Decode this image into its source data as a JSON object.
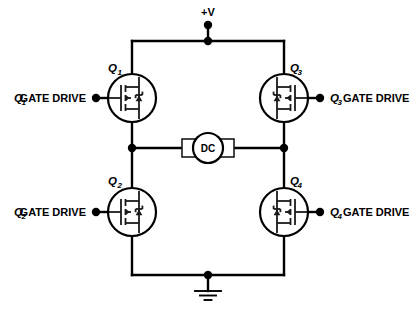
{
  "diagram": {
    "supply_label": "+V",
    "load_label": "DC",
    "ground_symbol": "earth-ground"
  },
  "transistors": [
    {
      "id": "Q1",
      "ref_letter": "Q",
      "ref_number": "1",
      "position": "top-left",
      "gate_side": "left"
    },
    {
      "id": "Q2",
      "ref_letter": "Q",
      "ref_number": "2",
      "position": "bottom-left",
      "gate_side": "left"
    },
    {
      "id": "Q3",
      "ref_letter": "Q",
      "ref_number": "3",
      "position": "top-right",
      "gate_side": "right"
    },
    {
      "id": "Q4",
      "ref_letter": "Q",
      "ref_number": "4",
      "position": "bottom-right",
      "gate_side": "right"
    }
  ],
  "gate_drives": [
    {
      "id": "gd1",
      "ref_letter": "Q",
      "ref_number": "1",
      "text": "GATE DRIVE",
      "side": "left"
    },
    {
      "id": "gd2",
      "ref_letter": "Q",
      "ref_number": "2",
      "text": "GATE DRIVE",
      "side": "left"
    },
    {
      "id": "gd3",
      "ref_letter": "Q",
      "ref_number": "3",
      "text": "GATE DRIVE",
      "side": "right"
    },
    {
      "id": "gd4",
      "ref_letter": "Q",
      "ref_number": "4",
      "text": "GATE DRIVE",
      "side": "right"
    }
  ],
  "colors": {
    "wire": "#000000",
    "symbol": "#1a1a1a",
    "background": "#ffffff",
    "text": "#000000"
  }
}
